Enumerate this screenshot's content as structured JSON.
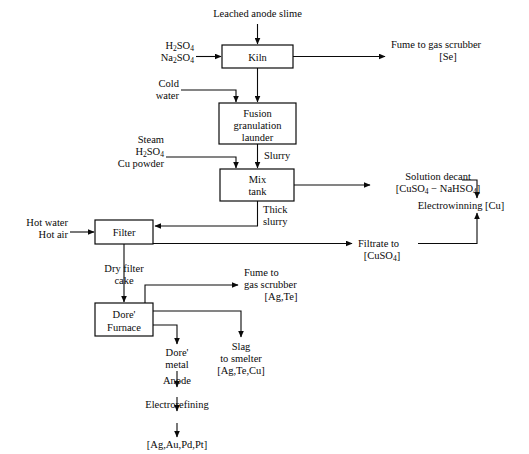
{
  "diagram": {
    "type": "process-flow-diagram",
    "stroke_color": "#0a0a0a",
    "background_color": "#ffffff"
  },
  "boxes": {
    "kiln": {
      "label": "Kiln",
      "x": 222,
      "y": 45,
      "w": 71,
      "h": 23
    },
    "fusion": {
      "line1": "Fusion",
      "line2": "granulation",
      "line3": "launder",
      "x": 219,
      "y": 103,
      "w": 77,
      "h": 41
    },
    "mix_tank": {
      "line1": "Mix",
      "line2": "tank",
      "x": 220,
      "y": 169,
      "w": 74,
      "h": 32
    },
    "filter": {
      "label": "Filter",
      "x": 95,
      "y": 220,
      "w": 58,
      "h": 24
    },
    "dore_furnace": {
      "line1": "Dore'",
      "line2": "Furnace",
      "x": 95,
      "y": 303,
      "w": 58,
      "h": 33
    }
  },
  "labels": {
    "leached_anode_slime": "Leached anode slime",
    "h2so4": "H",
    "h2so4_sub1": "2",
    "h2so4_mid": "SO",
    "h2so4_sub2": "4",
    "na2so4": "Na",
    "na2so4_sub1": "2",
    "na2so4_mid": "SO",
    "na2so4_sub2": "4",
    "fume_gas_scrubber_se_l1": "Fume to gas scrubber",
    "fume_gas_scrubber_se_l2": "[Se]",
    "cold": "Cold",
    "water": "water",
    "steam": "Steam",
    "cu_powder": "Cu powder",
    "slurry": "Slurry",
    "solution_decant": "Solution decant",
    "solution_decant_formula_a": "[CuSO",
    "solution_decant_formula_sub": "4",
    "solution_decant_formula_b": " − NaHSO",
    "solution_decant_formula_sub2": "4",
    "solution_decant_formula_c": "]",
    "electrowinning_cu": "Electrowinning [Cu]",
    "thick": "Thick",
    "slurry2": "slurry",
    "hot_water": "Hot water",
    "hot_air": "Hot air",
    "filtrate_to": "Filtrate to",
    "filtrate_formula_a": "[CuSO",
    "filtrate_formula_sub": "4",
    "filtrate_formula_b": "]",
    "dry_filter": "Dry filter",
    "cake": "cake",
    "fume_to": "Fume to",
    "gas_scrubber": "gas scrubber",
    "ag_te": "[Ag,Te]",
    "dore_metal_l1": "Dore'",
    "dore_metal_l2": "metal",
    "slag": "Slag",
    "to_smelter": "to smelter",
    "ag_te_cu": "[Ag,Te,Cu]",
    "anode": "Anode",
    "electrorefining": "Electrorefining",
    "final_products": "[Ag,Au,Pd,Pt]"
  },
  "flow_nodes": [
    {
      "id": "leached-anode-slime",
      "kind": "input",
      "text": "Leached anode slime"
    },
    {
      "id": "acid-feed",
      "kind": "input",
      "text": "H2SO4 / Na2SO4"
    },
    {
      "id": "kiln",
      "kind": "unit",
      "text": "Kiln"
    },
    {
      "id": "fume-se",
      "kind": "output",
      "text": "Fume to gas scrubber [Se]"
    },
    {
      "id": "cold-water",
      "kind": "input",
      "text": "Cold water"
    },
    {
      "id": "fusion-granulation-launder",
      "kind": "unit",
      "text": "Fusion granulation launder"
    },
    {
      "id": "steam-acid-cu",
      "kind": "input",
      "text": "Steam / H2SO4 / Cu powder"
    },
    {
      "id": "mix-tank",
      "kind": "unit",
      "text": "Mix tank"
    },
    {
      "id": "solution-decant",
      "kind": "output",
      "text": "Solution decant [CuSO4 - NaHSO4]"
    },
    {
      "id": "electrowinning",
      "kind": "output",
      "text": "Electrowinning [Cu]"
    },
    {
      "id": "hot-water-air",
      "kind": "input",
      "text": "Hot water / Hot air"
    },
    {
      "id": "filter",
      "kind": "unit",
      "text": "Filter"
    },
    {
      "id": "filtrate",
      "kind": "output",
      "text": "Filtrate to [CuSO4]"
    },
    {
      "id": "dore-furnace",
      "kind": "unit",
      "text": "Dore' Furnace"
    },
    {
      "id": "fume-ag-te",
      "kind": "output",
      "text": "Fume to gas scrubber [Ag,Te]"
    },
    {
      "id": "dore-metal",
      "kind": "intermediate",
      "text": "Dore' metal"
    },
    {
      "id": "slag",
      "kind": "output",
      "text": "Slag to smelter [Ag,Te,Cu]"
    },
    {
      "id": "anode",
      "kind": "intermediate",
      "text": "Anode"
    },
    {
      "id": "electrorefining",
      "kind": "unit",
      "text": "Electrorefining"
    },
    {
      "id": "final",
      "kind": "output",
      "text": "[Ag,Au,Pd,Pt]"
    }
  ]
}
